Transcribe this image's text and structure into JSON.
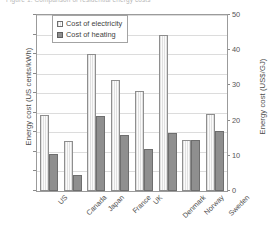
{
  "top_caption": "Figure 1. Comparison of residential energy costs",
  "chart_data": {
    "type": "bar",
    "title": "",
    "xlabel": "",
    "ylabel": "Energy cost (US cents/kWh)",
    "y2label": "Energy cost (US$/GJ)",
    "categories": [
      "US",
      "Canada",
      "Japan",
      "France",
      "UK",
      "Denmark",
      "Norway",
      "Sweden"
    ],
    "series": [
      {
        "name": "Cost of electricity",
        "values": [
          7.8,
          5.1,
          14.0,
          11.4,
          10.2,
          16.0,
          5.2,
          7.9
        ],
        "fill": "#f3f3f3",
        "edge": "#8e8e8e"
      },
      {
        "name": "Cost of heating",
        "values": [
          3.8,
          1.6,
          7.7,
          5.7,
          4.3,
          5.9,
          5.2,
          6.1
        ],
        "fill": "#8f8f8f",
        "edge": "#6e6e6e"
      }
    ],
    "ylim": [
      0,
      18
    ],
    "yticks": [
      0,
      2,
      4,
      6,
      8,
      10,
      12,
      14,
      16,
      18
    ],
    "y2lim": [
      0,
      50
    ],
    "y2ticks": [
      0,
      10,
      20,
      30,
      40,
      50
    ],
    "grid": true,
    "legend_position": "upper-left-inside"
  }
}
